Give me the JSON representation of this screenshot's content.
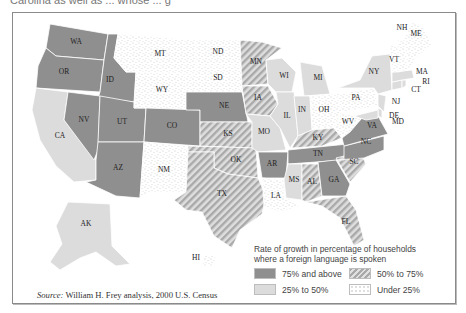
{
  "header_fragment": "Carolina as well as ... whose ... g",
  "legend": {
    "title_line1": "Rate of growth in percentage of households",
    "title_line2": "where a foreign language is spoken",
    "items": [
      {
        "key": "high",
        "label": "75% and above",
        "color": "#8f8f8f",
        "pattern": "solid"
      },
      {
        "key": "midhigh",
        "label": "50% to 75%",
        "color": "#b8b8b8",
        "pattern": "diagonal-hatch"
      },
      {
        "key": "mid",
        "label": "25% to 50%",
        "color": "#dcdcdc",
        "pattern": "solid"
      },
      {
        "key": "low",
        "label": "Under 25%",
        "color": "#ffffff",
        "pattern": "stipple"
      }
    ]
  },
  "source": {
    "prefix": "Source:",
    "text": "William H. Frey analysis, 2000 U.S. Census"
  },
  "states": {
    "WA": "high",
    "OR": "high",
    "ID": "high",
    "NV": "high",
    "UT": "high",
    "CO": "high",
    "AZ": "high",
    "NE": "high",
    "AR": "high",
    "TN": "high",
    "GA": "high",
    "NC": "high",
    "VA": "high",
    "CA": "mid",
    "AK": "mid",
    "WI": "mid",
    "MI": "mid",
    "IL": "mid",
    "IN": "mid",
    "MO": "mid",
    "MS": "mid",
    "NY": "mid",
    "MA": "mid",
    "RI": "mid",
    "CT": "mid",
    "NJ": "mid",
    "DE": "mid",
    "MD": "mid",
    "MN": "midhigh",
    "IA": "midhigh",
    "KS": "midhigh",
    "OK": "midhigh",
    "TX": "midhigh",
    "KY": "midhigh",
    "AL": "midhigh",
    "SC": "midhigh",
    "FL": "midhigh",
    "MT": "low",
    "WY": "low",
    "ND": "low",
    "SD": "low",
    "NM": "low",
    "LA": "low",
    "OH": "low",
    "PA": "low",
    "WV": "low",
    "VT": "low",
    "NH": "low",
    "ME": "low",
    "HI": "low"
  },
  "labels": {
    "WA": "WA",
    "OR": "OR",
    "ID": "ID",
    "NV": "NV",
    "CA": "CA",
    "UT": "UT",
    "AZ": "AZ",
    "MT": "MT",
    "WY": "WY",
    "CO": "CO",
    "NM": "NM",
    "ND": "ND",
    "SD": "SD",
    "NE": "NE",
    "KS": "KS",
    "OK": "OK",
    "TX": "TX",
    "MN": "MN",
    "IA": "IA",
    "MO": "MO",
    "AR": "AR",
    "LA": "LA",
    "WI": "WI",
    "IL": "IL",
    "MI": "MI",
    "IN": "IN",
    "OH": "OH",
    "KY": "KY",
    "TN": "TN",
    "MS": "MS",
    "AL": "AL",
    "GA": "GA",
    "FL": "FL",
    "SC": "SC",
    "NC": "NC",
    "VA": "VA",
    "WV": "WV",
    "PA": "PA",
    "NY": "NY",
    "VT": "VT",
    "NH": "NH",
    "ME": "ME",
    "MA": "MA",
    "RI": "RI",
    "CT": "CT",
    "NJ": "NJ",
    "DE": "DE",
    "MD": "MD",
    "AK": "AK",
    "HI": "HI"
  }
}
